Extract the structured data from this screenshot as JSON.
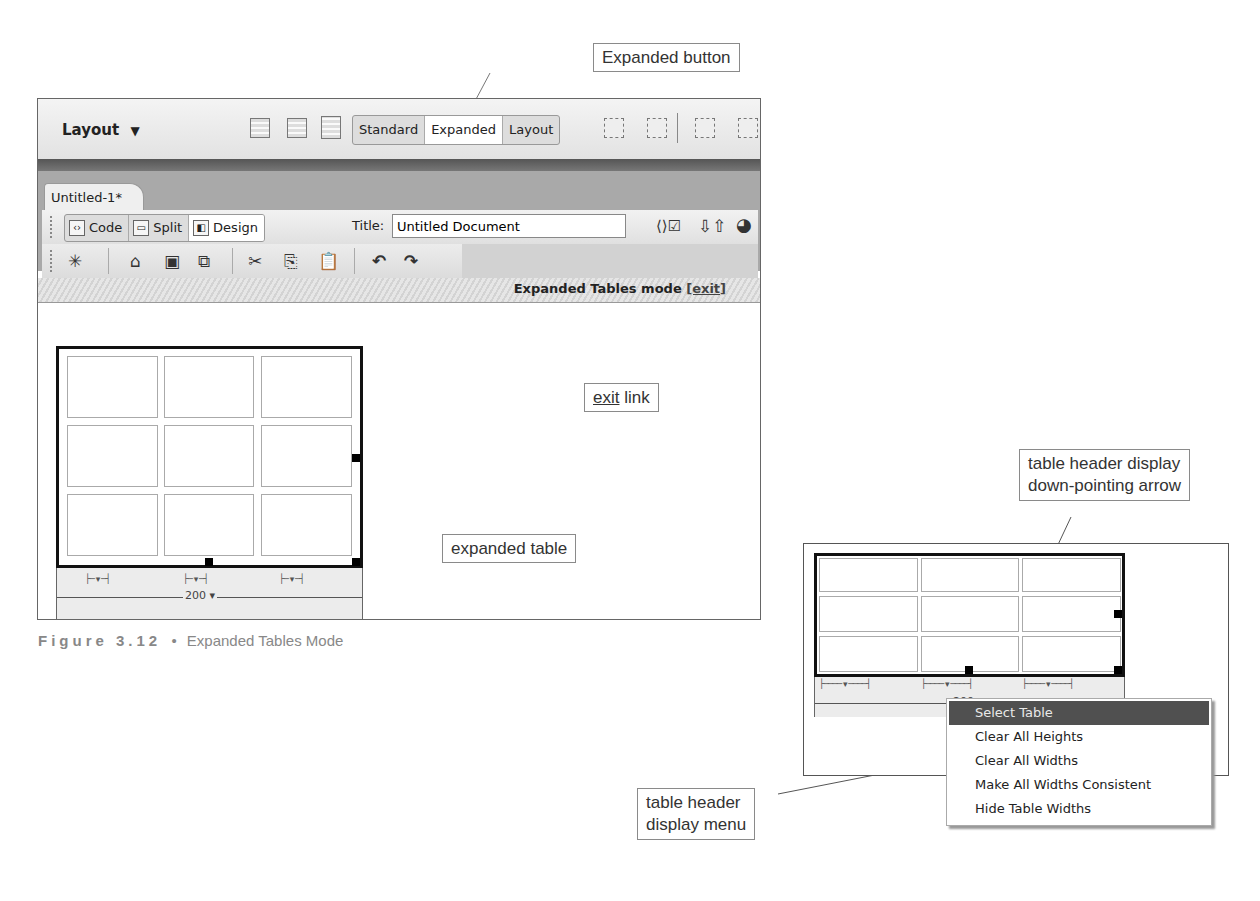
{
  "callouts": {
    "expanded_button": "Expanded button",
    "exit_link_underlined": "exit",
    "exit_link_rest": " link",
    "expanded_table": "expanded table",
    "header_arrow_line1": "table header display",
    "header_arrow_line2": "down-pointing arrow",
    "header_menu_line1": "table header",
    "header_menu_line2": "display menu"
  },
  "insert_bar": {
    "category": "Layout",
    "category_icon": "dropdown-triangle-icon",
    "icons_left": [
      "table-icon",
      "insert-div-icon",
      "layer-icon"
    ],
    "mode_buttons": [
      {
        "label": "Standard",
        "active": false
      },
      {
        "label": "Expanded",
        "active": true
      },
      {
        "label": "Layout",
        "active": false
      }
    ],
    "icons_right": [
      "layout-table-icon",
      "draw-layout-cell-icon",
      "insert-row-above-icon",
      "insert-row-below-icon"
    ]
  },
  "document": {
    "tab_label": "Untitled-1*",
    "views": [
      {
        "label": "Code",
        "icon": "code-view-icon",
        "active": false
      },
      {
        "label": "Split",
        "icon": "split-view-icon",
        "active": false
      },
      {
        "label": "Design",
        "icon": "design-view-icon",
        "active": true
      }
    ],
    "title_label": "Title:",
    "title_value": "Untitled Document",
    "toolbar_right_icons": [
      "validate-markup-icon",
      "file-management-icon",
      "preview-browser-icon"
    ],
    "standard_toolbar_icons": [
      "new-file-icon",
      "open-icon",
      "save-icon",
      "save-all-icon",
      "cut-icon",
      "copy-icon",
      "paste-icon",
      "undo-icon",
      "redo-icon"
    ],
    "mode_bar_text": "Expanded Tables mode ",
    "mode_bar_link": "[exit]"
  },
  "table1": {
    "rows": 3,
    "cols": 3,
    "total_width": "200",
    "column_indicator": "├─ ▾ ─┤"
  },
  "caption1": {
    "number": "Figure 3.12",
    "bullet": "•",
    "title": "Expanded Tables Mode"
  },
  "table2": {
    "rows": 3,
    "cols": 3,
    "total_width": "200 ▾",
    "column_indicator": "├──── ▾ ────┤"
  },
  "context_menu": {
    "items": [
      {
        "label": "Select Table",
        "highlighted": true
      },
      {
        "label": "Clear All Heights",
        "highlighted": false
      },
      {
        "label": "Clear All Widths",
        "highlighted": false
      },
      {
        "label": "Make All Widths Consistent",
        "highlighted": false
      },
      {
        "label": "Hide Table Widths",
        "highlighted": false
      }
    ]
  }
}
